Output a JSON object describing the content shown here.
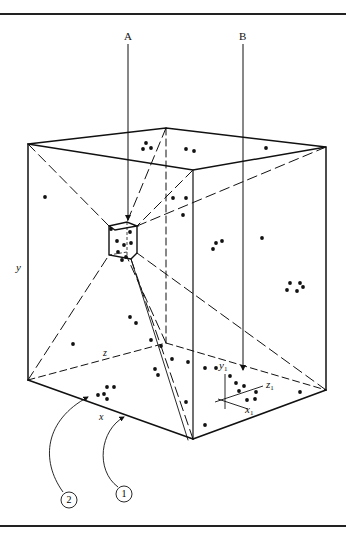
{
  "figure": {
    "colors": {
      "ink": "#111111",
      "background": "#ffffff"
    },
    "labels": {
      "arrow_a": "A",
      "arrow_b": "B",
      "axis_y": "y",
      "axis_z": "z",
      "axis_x": "x",
      "local_y": "y",
      "local_y_sub": "1",
      "local_z": "z",
      "local_z_sub": "1",
      "local_x": "x",
      "local_x_sub": "1",
      "callout_1": "1",
      "callout_2": "2"
    },
    "points": [
      [
        146,
        143
      ],
      [
        143,
        149
      ],
      [
        151,
        148
      ],
      [
        186,
        149
      ],
      [
        194,
        151
      ],
      [
        266,
        148
      ],
      [
        45,
        197
      ],
      [
        173,
        198
      ],
      [
        186,
        198
      ],
      [
        183,
        215
      ],
      [
        262,
        238
      ],
      [
        216,
        243
      ],
      [
        222,
        241
      ],
      [
        213,
        249
      ],
      [
        290,
        283
      ],
      [
        300,
        283
      ],
      [
        287,
        290
      ],
      [
        297,
        291
      ],
      [
        303,
        287
      ],
      [
        130,
        317
      ],
      [
        136,
        323
      ],
      [
        73,
        344
      ],
      [
        151,
        340
      ],
      [
        161,
        346
      ],
      [
        172,
        359
      ],
      [
        188,
        362
      ],
      [
        205,
        368
      ],
      [
        216,
        368
      ],
      [
        155,
        369
      ],
      [
        158,
        375
      ],
      [
        107,
        387
      ],
      [
        98,
        395
      ],
      [
        104,
        394
      ],
      [
        107,
        399
      ],
      [
        114,
        387
      ],
      [
        230,
        376
      ],
      [
        236,
        383
      ],
      [
        239,
        391
      ],
      [
        244,
        386
      ],
      [
        247,
        400
      ],
      [
        255,
        399
      ],
      [
        256,
        392
      ],
      [
        300,
        392
      ],
      [
        186,
        402
      ],
      [
        205,
        425
      ],
      [
        111,
        229
      ],
      [
        130,
        232
      ],
      [
        117,
        241
      ],
      [
        124,
        245
      ],
      [
        131,
        243
      ],
      [
        118,
        252
      ],
      [
        126,
        257
      ],
      [
        122,
        260
      ]
    ]
  }
}
